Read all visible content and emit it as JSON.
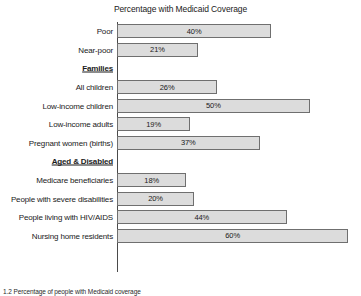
{
  "chart_data": {
    "type": "bar",
    "orientation": "horizontal",
    "title": "Percentage with Medicaid Coverage",
    "xlabel": "",
    "ylabel": "",
    "xlim": [
      0,
      63
    ],
    "grid": false,
    "legend": null,
    "value_suffix": "%",
    "categories": [
      "Poor",
      "Near-poor",
      "Families",
      "All children",
      "Low-income children",
      "Low-income adults",
      "Pregnant women (births)",
      "Aged & Disabled",
      "Medicare beneficiaries",
      "People with severe disabilities",
      "People living with HIV/AIDS",
      "Nursing home residents"
    ],
    "values": [
      40,
      21,
      null,
      26,
      50,
      19,
      37,
      null,
      18,
      20,
      44,
      60
    ],
    "value_labels": [
      "40%",
      "21%",
      "",
      "26%",
      "50%",
      "19%",
      "37%",
      "",
      "18%",
      "20%",
      "44%",
      "60%"
    ],
    "section_headers": [
      "Families",
      "Aged & Disabled"
    ],
    "colors": {
      "bar_fill": "#dcdcdc",
      "bar_border": "#6f6f6f",
      "axis": "#4a4a4a",
      "text": "#1a1a1a",
      "background": "#ffffff"
    }
  },
  "rows": [
    {
      "label": "Poor",
      "value": 40,
      "value_label": "40%",
      "is_section": false
    },
    {
      "label": "Near-poor",
      "value": 21,
      "value_label": "21%",
      "is_section": false
    },
    {
      "label": "Families",
      "value": null,
      "value_label": "",
      "is_section": true
    },
    {
      "label": "All children",
      "value": 26,
      "value_label": "26%",
      "is_section": false
    },
    {
      "label": "Low-income children",
      "value": 50,
      "value_label": "50%",
      "is_section": false
    },
    {
      "label": "Low-income adults",
      "value": 19,
      "value_label": "19%",
      "is_section": false
    },
    {
      "label": "Pregnant women (births)",
      "value": 37,
      "value_label": "37%",
      "is_section": false
    },
    {
      "label": "Aged & Disabled",
      "value": null,
      "value_label": "",
      "is_section": true
    },
    {
      "label": "Medicare beneficiaries",
      "value": 18,
      "value_label": "18%",
      "is_section": false
    },
    {
      "label": "People with severe disabilities",
      "value": 20,
      "value_label": "20%",
      "is_section": false
    },
    {
      "label": "People living with HIV/AIDS",
      "value": 44,
      "value_label": "44%",
      "is_section": false
    },
    {
      "label": "Nursing home residents",
      "value": 60,
      "value_label": "60%",
      "is_section": false
    }
  ],
  "caption": "1.2   Percentage of people with Medicaid coverage"
}
